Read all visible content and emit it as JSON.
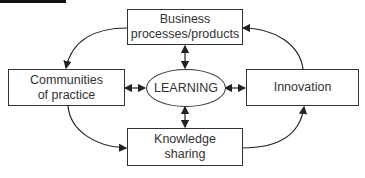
{
  "diagram": {
    "center": {
      "label": "LEARNING"
    },
    "nodes": [
      {
        "id": "business",
        "label_line1": "Business",
        "label_line2": "processes/products"
      },
      {
        "id": "communities",
        "label_line1": "Communities",
        "label_line2": "of practice"
      },
      {
        "id": "innovation",
        "label_line1": "Innovation"
      },
      {
        "id": "knowledge",
        "label_line1": "Knowledge",
        "label_line2": "sharing"
      }
    ],
    "edges": [
      {
        "from": "business",
        "to": "communities",
        "type": "curved-arrow"
      },
      {
        "from": "communities",
        "to": "knowledge",
        "type": "curved-arrow"
      },
      {
        "from": "knowledge",
        "to": "innovation",
        "type": "curved-arrow"
      },
      {
        "from": "innovation",
        "to": "business",
        "type": "curved-arrow"
      },
      {
        "from": "LEARNING",
        "to": "business",
        "type": "bidirectional"
      },
      {
        "from": "LEARNING",
        "to": "communities",
        "type": "bidirectional"
      },
      {
        "from": "LEARNING",
        "to": "innovation",
        "type": "bidirectional"
      },
      {
        "from": "LEARNING",
        "to": "knowledge",
        "type": "bidirectional"
      }
    ]
  }
}
